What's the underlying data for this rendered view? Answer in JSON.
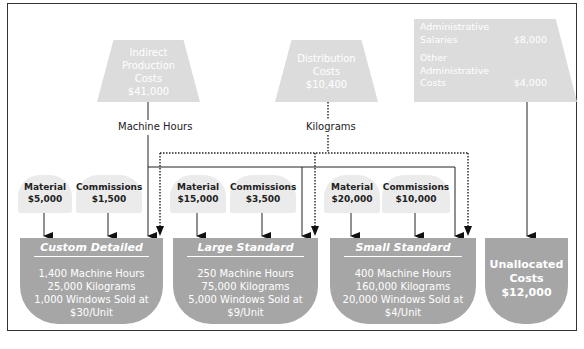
{
  "pools": [
    {
      "id": "indirect",
      "lines": [
        "Indirect",
        "Production",
        "Costs",
        "$41,000"
      ]
    },
    {
      "id": "distribution",
      "lines": [
        "Distribution",
        "Costs",
        "$10,400"
      ]
    },
    {
      "id": "admin",
      "items": [
        {
          "label": [
            "Administrative",
            "Salaries"
          ],
          "value": "$8,000"
        },
        {
          "label": [
            "Other",
            "Administrative",
            "Costs"
          ],
          "value": "$4,000"
        }
      ]
    }
  ],
  "drivers": {
    "machine_hours": "Machine Hours",
    "kilograms": "Kilograms"
  },
  "direct_costs": [
    {
      "label": "Material",
      "value": "$5,000"
    },
    {
      "label": "Commissions",
      "value": "$1,500"
    },
    {
      "label": "Material",
      "value": "$15,000"
    },
    {
      "label": "Commissions",
      "value": "$3,500"
    },
    {
      "label": "Material",
      "value": "$20,000"
    },
    {
      "label": "Commissions",
      "value": "$10,000"
    }
  ],
  "products": [
    {
      "title": "Custom Detailed",
      "lines": [
        "1,400 Machine Hours",
        "25,000 Kilograms",
        "1,000 Windows Sold at",
        "$30/Unit"
      ]
    },
    {
      "title": "Large Standard",
      "lines": [
        "250 Machine Hours",
        "75,000 Kilograms",
        "5,000 Windows Sold at",
        "$9/Unit"
      ]
    },
    {
      "title": "Small Standard",
      "lines": [
        "400 Machine Hours",
        "160,000 Kilograms",
        "20,000 Windows Sold at",
        "$4/Unit"
      ]
    }
  ],
  "unallocated": {
    "lines": [
      "Unallocated",
      "Costs",
      "$12,000"
    ]
  },
  "colors": {
    "pool": "#dcdcdc",
    "product": "#a6a6a6",
    "bump": "#ebebeb",
    "line": "#222222"
  }
}
